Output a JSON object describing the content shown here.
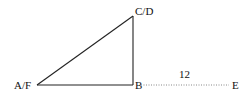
{
  "diagram": {
    "type": "geometry",
    "colors": {
      "stroke": "#222222",
      "dotted": "#888888",
      "text": "#111111",
      "background": "#ffffff"
    },
    "points": {
      "AF": {
        "label": "A/F",
        "x": 37,
        "y": 85
      },
      "B": {
        "label": "B",
        "x": 133,
        "y": 85
      },
      "CD": {
        "label": "C/D",
        "x": 133,
        "y": 16
      },
      "E": {
        "label": "E",
        "x": 230,
        "y": 85
      }
    },
    "segments": [
      {
        "from": "A/F",
        "to": "C/D",
        "style": "solid"
      },
      {
        "from": "C/D",
        "to": "B",
        "style": "solid"
      },
      {
        "from": "A/F",
        "to": "B",
        "style": "solid"
      },
      {
        "from": "B",
        "to": "E",
        "style": "dotted",
        "length_label": "12"
      }
    ],
    "labels": {
      "af": "A/F",
      "b": "B",
      "cd": "C/D",
      "e": "E",
      "be_length": "12"
    }
  }
}
